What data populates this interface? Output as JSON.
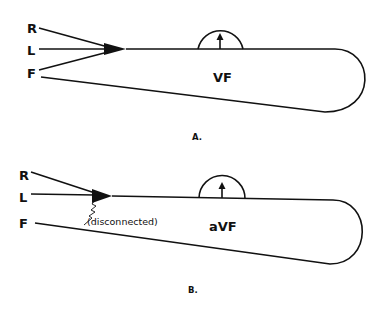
{
  "figure": {
    "type": "lead-connection-schematic",
    "panels": [
      {
        "id": "A",
        "panel_label": "A.",
        "leads": [
          {
            "label": "R",
            "connected": true
          },
          {
            "label": "L",
            "connected": true
          },
          {
            "label": "F",
            "connected": true
          }
        ],
        "meter_symbol": "galvanometer-arrow-up",
        "region_label": "VF",
        "note": ""
      },
      {
        "id": "B",
        "panel_label": "B.",
        "leads": [
          {
            "label": "R",
            "connected": true
          },
          {
            "label": "L",
            "connected": true
          },
          {
            "label": "F",
            "connected": false
          }
        ],
        "meter_symbol": "galvanometer-arrow-up",
        "region_label": "aVF",
        "note": "(disconnected)"
      }
    ]
  },
  "colors": {
    "ink": "#111111",
    "background": "#ffffff"
  }
}
